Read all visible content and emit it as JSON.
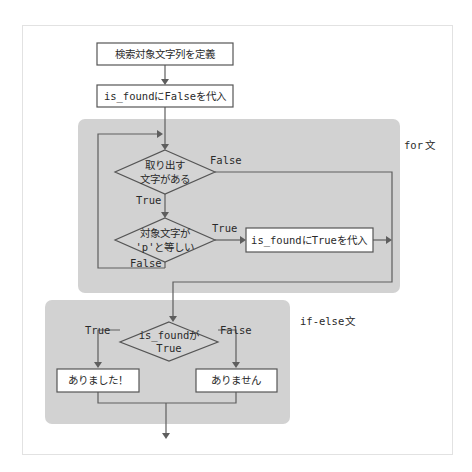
{
  "diagram": {
    "type": "flowchart",
    "colors": {
      "region_fill": "#d2d2d2",
      "line": "#5e5e5e",
      "box_fill": "#ffffff",
      "frame_border": "#e2e2e2"
    },
    "nodes": {
      "define_string": "検索対象文字列を定義",
      "init_false": {
        "code": "is_found",
        "mid": "に",
        "value": "False",
        "tail": "を代入"
      },
      "has_char": {
        "line1": "取り出す",
        "line2": "文字がある"
      },
      "equals_p": {
        "line1": "対象文字が",
        "line2_code": "'p'",
        "line2_tail": "と等しい"
      },
      "set_true": {
        "code": "is_found",
        "mid": "に",
        "value": "True",
        "tail": "を代入"
      },
      "is_found_true": {
        "line1_code": "is_found",
        "line1_tail": "が",
        "line2": "True"
      },
      "found": "ありました！",
      "not_found": "ありません"
    },
    "edge_labels": {
      "has_char_false": "False",
      "has_char_true": "True",
      "equals_p_true": "True",
      "equals_p_false": "False",
      "if_true": "True",
      "if_false": "False"
    },
    "regions": {
      "for_label_code": "for",
      "for_label_tail": "文",
      "ifelse_label_code": "if-else",
      "ifelse_label_tail": "文"
    }
  }
}
